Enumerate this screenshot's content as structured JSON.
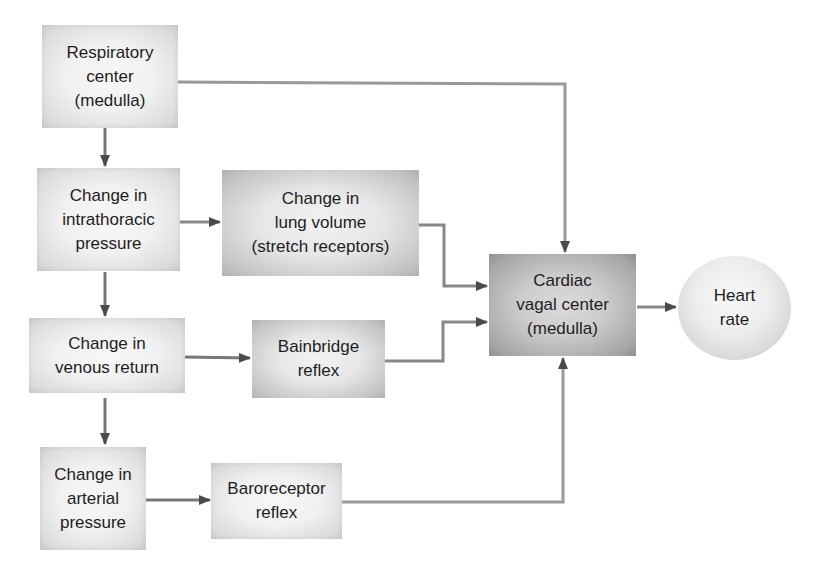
{
  "diagram": {
    "type": "flowchart",
    "colors": {
      "line": "#8a8a8a",
      "arrowhead": "#4a4a4a",
      "box_light": "#eeeeee",
      "box_dark": "#bdbdbd"
    },
    "nodes": {
      "respiratory_center": {
        "label": "Respiratory\ncenter\n(medulla)"
      },
      "intrathoracic_pressure": {
        "label": "Change in\nintrathoracic\npressure"
      },
      "lung_volume": {
        "label": "Change in\nlung volume\n(stretch receptors)"
      },
      "venous_return": {
        "label": "Change in\nvenous return"
      },
      "bainbridge_reflex": {
        "label": "Bainbridge\nreflex"
      },
      "arterial_pressure": {
        "label": "Change in\narterial\npressure"
      },
      "baroreceptor_reflex": {
        "label": "Baroreceptor\nreflex"
      },
      "cardiac_vagal_center": {
        "label": "Cardiac\nvagal center\n(medulla)"
      },
      "heart_rate": {
        "label": "Heart\nrate"
      }
    },
    "edges": [
      {
        "from": "Respiratory center (medulla)",
        "to": "Change in intrathoracic pressure"
      },
      {
        "from": "Respiratory center (medulla)",
        "to": "Cardiac vagal center (medulla)"
      },
      {
        "from": "Change in intrathoracic pressure",
        "to": "Change in lung volume (stretch receptors)"
      },
      {
        "from": "Change in intrathoracic pressure",
        "to": "Change in venous return"
      },
      {
        "from": "Change in lung volume (stretch receptors)",
        "to": "Cardiac vagal center (medulla)"
      },
      {
        "from": "Change in venous return",
        "to": "Bainbridge reflex"
      },
      {
        "from": "Change in venous return",
        "to": "Change in arterial pressure"
      },
      {
        "from": "Bainbridge reflex",
        "to": "Cardiac vagal center (medulla)"
      },
      {
        "from": "Change in arterial pressure",
        "to": "Baroreceptor reflex"
      },
      {
        "from": "Baroreceptor reflex",
        "to": "Cardiac vagal center (medulla)"
      },
      {
        "from": "Cardiac vagal center (medulla)",
        "to": "Heart rate"
      }
    ]
  }
}
